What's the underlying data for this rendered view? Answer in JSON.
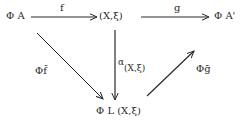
{
  "diagram": {
    "type": "commutative-diagram",
    "nodes": {
      "top_left": "Φ A",
      "top_center": "(X,ξ)",
      "top_right": "Φ A'",
      "bottom": "Φ L (X,ξ)"
    },
    "arrows": {
      "f": {
        "from": "Φ A",
        "to": "(X,ξ)",
        "label": "f"
      },
      "g": {
        "from": "(X,ξ)",
        "to": "Φ A'",
        "label": "g"
      },
      "alpha": {
        "from": "(X,ξ)",
        "to": "Φ L (X,ξ)",
        "label": "α",
        "label_sub": "(X,ξ)"
      },
      "phi_f_bar": {
        "from": "Φ A",
        "to": "Φ L (X,ξ)",
        "label": "Φf̄"
      },
      "phi_g_bar": {
        "from": "Φ L (X,ξ)",
        "to": "Φ A'",
        "label": "Φḡ"
      }
    },
    "colors": {
      "ink": "#2a2a2a",
      "background": "#ffffff"
    }
  }
}
